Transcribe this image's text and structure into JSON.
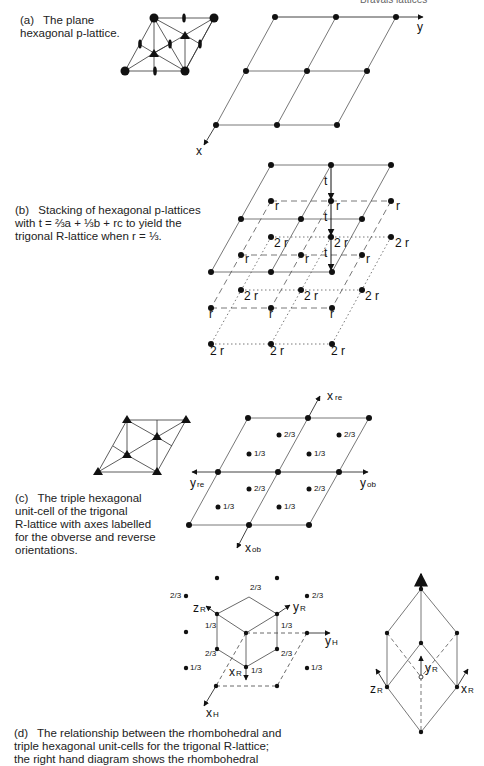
{
  "header": {
    "running_title": "Bravais lattices"
  },
  "panels": {
    "a": {
      "tag": "(a)",
      "caption_line1": "The plane",
      "caption_line2": "hexagonal p-lattice.",
      "axis_x": "x",
      "axis_y": "y"
    },
    "b": {
      "tag": "(b)",
      "caption_line1": "Stacking of hexagonal p-lattices",
      "caption_line2": "with t = ⅔a + ⅓b + rc to yield the",
      "caption_line3": "trigonal R-lattice when r = ⅓.",
      "label_t": "t",
      "label_r": "r",
      "label_2r": "2 r"
    },
    "c": {
      "tag": "(c)",
      "caption_line1": "The triple hexagonal",
      "caption_line2": "unit-cell of the trigonal",
      "caption_line3": "R-lattice with axes labelled",
      "caption_line4": "for the obverse and reverse",
      "caption_line5": "orientations.",
      "axis_x_re": "x",
      "axis_x_re_sub": "re",
      "axis_y_re": "y",
      "axis_y_re_sub": "re",
      "axis_y_ob": "y",
      "axis_y_ob_sub": "ob",
      "axis_x_ob": "x",
      "axis_x_ob_sub": "ob",
      "frac_one_third": "1/3",
      "frac_two_thirds": "2/3"
    },
    "d": {
      "tag": "(d)",
      "caption_line1": "The relationship between the rhombohedral and",
      "caption_line2": "triple hexagonal unit-cells for the trigonal R-lattice;",
      "caption_line3": "the right hand diagram shows the rhombohedral",
      "axis_zR": "z",
      "axis_yR": "y",
      "axis_xR": "x",
      "axis_yH": "y",
      "axis_xH": "x",
      "sub_R": "R",
      "sub_H": "H"
    }
  }
}
